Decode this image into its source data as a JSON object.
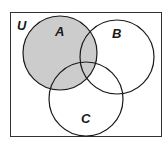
{
  "diagram": {
    "type": "venn",
    "universe_label": "U",
    "sets": [
      {
        "label": "A",
        "shaded": true
      },
      {
        "label": "B",
        "shaded": false
      },
      {
        "label": "C",
        "shaded": false
      }
    ],
    "shaded_region": "A",
    "colors": {
      "shade": "#cccccc",
      "stroke": "#1a1a1a",
      "background": "#ffffff"
    }
  }
}
